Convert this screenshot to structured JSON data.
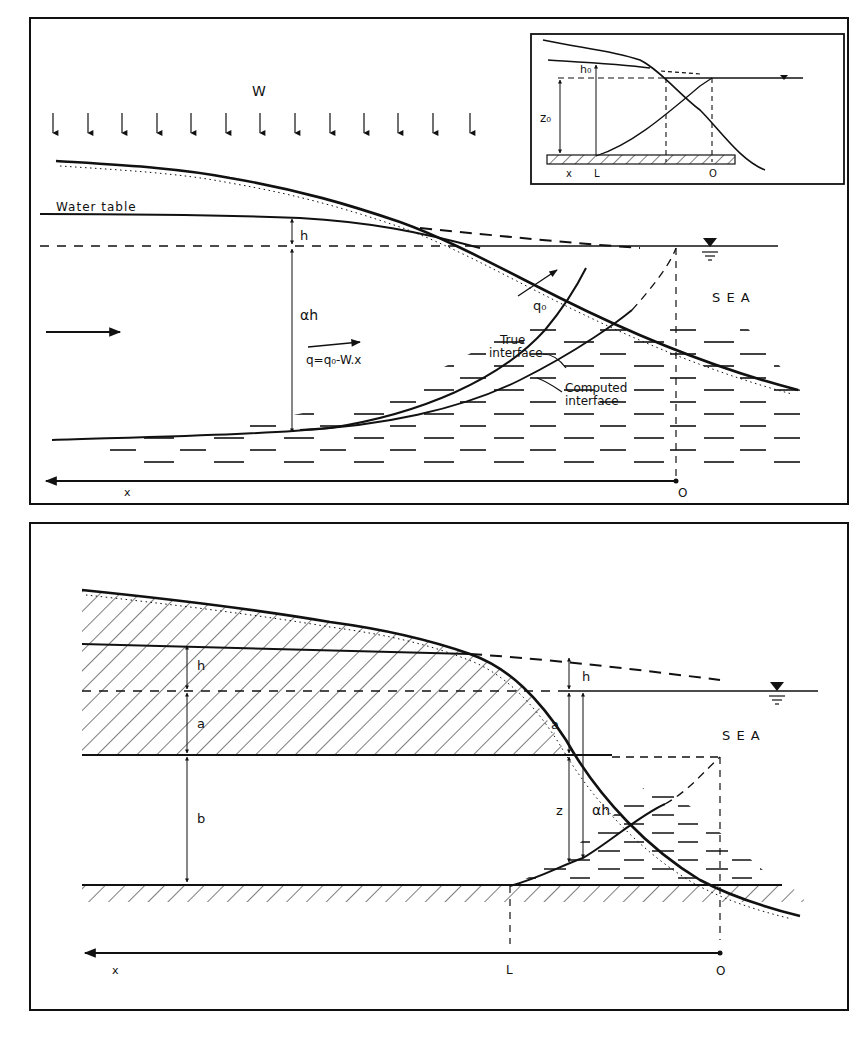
{
  "figure_top": {
    "recharge_label": "W",
    "water_table_label": "Water table",
    "h_label": "h",
    "alpha_h_label": "αh",
    "flux_label": "q=q₀-W.x",
    "outflow_label": "q₀",
    "sea_label": "S E A",
    "true_interface_label": "True interface",
    "true_interface_line1": "True",
    "true_interface_line2": "interface",
    "computed_interface_line1": "Computed",
    "computed_interface_line2": "interface",
    "x_axis_label": "x",
    "origin_label": "O",
    "inset": {
      "h0_label": "h₀",
      "z0_label": "z₀",
      "x_label": "x",
      "L_label": "L",
      "origin_label": "O"
    }
  },
  "figure_bottom": {
    "h_left_label": "h",
    "a_left_label": "a",
    "b_label": "b",
    "h_right_label": "h",
    "a_right_label": "a",
    "z_label": "z",
    "alpha_h_label": "αh",
    "sea_label": "S E A",
    "x_axis_label": "x",
    "L_label": "L",
    "origin_label": "O"
  },
  "colors": {
    "ink": "#111111",
    "paper": "#ffffff"
  }
}
